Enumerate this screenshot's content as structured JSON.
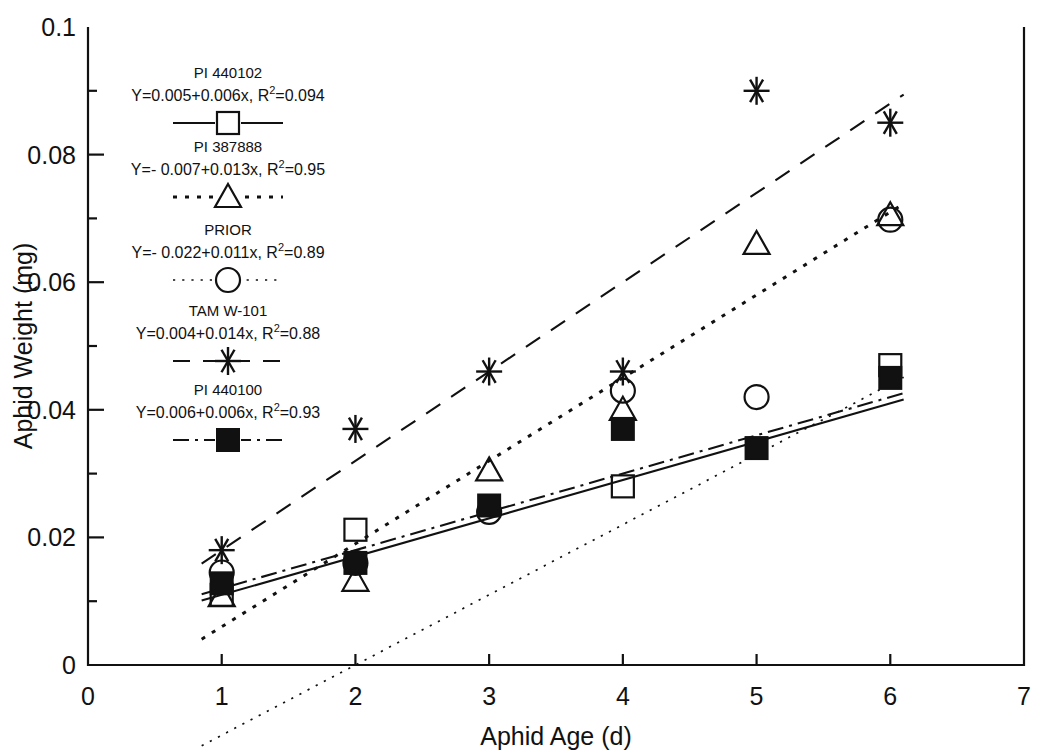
{
  "chart_data": {
    "type": "scatter",
    "title": "",
    "xlabel": "Aphid Age (d)",
    "ylabel": "Aphid Weight (mg)",
    "xlim": [
      0,
      7
    ],
    "ylim": [
      0,
      0.1
    ],
    "xticks": [
      "0",
      "1",
      "2",
      "3",
      "4",
      "5",
      "6",
      "7"
    ],
    "xtick_values": [
      0,
      1,
      2,
      3,
      4,
      5,
      6,
      7
    ],
    "yticks": [
      "0",
      "0.02",
      "0.04",
      "0.06",
      "0.08",
      "0.1"
    ],
    "ytick_values": [
      0,
      0.02,
      0.04,
      0.06,
      0.08,
      0.1
    ],
    "minor_yticks": [
      0.01,
      0.03,
      0.05,
      0.07,
      0.09
    ],
    "grid": false,
    "legend_position": "upper-left-inside",
    "x": [
      1,
      2,
      3,
      4,
      5,
      6
    ],
    "series": [
      {
        "name": "PI 440102",
        "equation": "Y=0.005+0.006x, R",
        "r2_sup": "2",
        "r2_value": "=0.094",
        "marker": "open-square",
        "line_style": "solid",
        "intercept": 0.005,
        "slope": 0.006,
        "r2": 0.094,
        "values": [
          0.011,
          0.0212,
          null,
          0.028,
          null,
          0.047
        ]
      },
      {
        "name": "PI 387888",
        "equation": "Y=- 0.007+0.013x, R",
        "r2_sup": "2",
        "r2_value": "=0.95",
        "marker": "open-triangle",
        "line_style": "dotted-coarse",
        "intercept": -0.007,
        "slope": 0.013,
        "r2": 0.95,
        "values": [
          0.0108,
          0.0132,
          0.0305,
          0.04,
          0.066,
          0.0705
        ]
      },
      {
        "name": "PRIOR",
        "equation": "Y=- 0.022+0.011x, R",
        "r2_sup": "2",
        "r2_value": "=0.89",
        "marker": "open-circle",
        "line_style": "dotted-fine",
        "intercept": -0.022,
        "slope": 0.011,
        "r2": 0.89,
        "values": [
          0.0145,
          0.016,
          0.024,
          0.043,
          0.042,
          0.0698
        ]
      },
      {
        "name": "TAM W-101",
        "equation": "Y=0.004+0.014x, R",
        "r2_sup": "2",
        "r2_value": "=0.88",
        "marker": "asterisk",
        "line_style": "dashed",
        "intercept": 0.004,
        "slope": 0.014,
        "r2": 0.88,
        "values": [
          0.018,
          0.037,
          0.046,
          0.046,
          0.09,
          0.085
        ]
      },
      {
        "name": "PI 440100",
        "equation": "Y=0.006+0.006x, R",
        "r2_sup": "2",
        "r2_value": "=0.93",
        "marker": "filled-square",
        "line_style": "dash-dot",
        "intercept": 0.006,
        "slope": 0.006,
        "r2": 0.93,
        "values": [
          0.0128,
          0.016,
          0.025,
          0.037,
          0.034,
          0.045
        ]
      }
    ]
  }
}
